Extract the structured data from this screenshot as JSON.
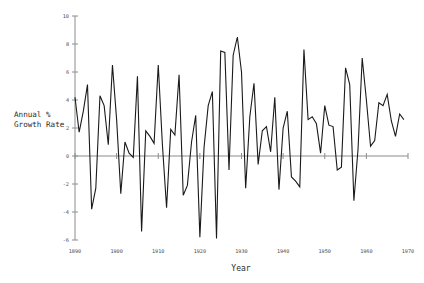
{
  "chart_data": {
    "type": "line",
    "title": "",
    "subtitle": "",
    "xlabel": "Year",
    "ylabel": "Annual %\nGrowth Rate",
    "ylabel_line1": "Annual %",
    "ylabel_line2": "Growth Rate",
    "xlim": [
      1890,
      1970
    ],
    "ylim": [
      -6,
      10
    ],
    "xticks": [
      1890,
      1900,
      1910,
      1920,
      1930,
      1940,
      1950,
      1960,
      1970
    ],
    "xtick_labels": [
      "1890",
      "1900",
      "1910",
      "1920",
      "1930",
      "1940",
      "1950",
      "1960",
      "1970"
    ],
    "yticks": [
      -6,
      -4,
      -2,
      0,
      2,
      4,
      6,
      8,
      10
    ],
    "ytick_labels": [
      "-6",
      "-4",
      "-2",
      "0",
      "2",
      "4",
      "6",
      "8",
      "10"
    ],
    "grid": false,
    "legend": null,
    "legend_position": "none",
    "zero_line": true,
    "line_color": "#1a1a1a",
    "axis_color": "#8c8c8c",
    "background_color": "#ffffff",
    "x": [
      1890,
      1891,
      1892,
      1893,
      1894,
      1895,
      1896,
      1897,
      1898,
      1899,
      1900,
      1901,
      1902,
      1903,
      1904,
      1905,
      1906,
      1907,
      1908,
      1909,
      1910,
      1911,
      1912,
      1913,
      1914,
      1915,
      1916,
      1917,
      1918,
      1919,
      1920,
      1921,
      1922,
      1923,
      1924,
      1925,
      1926,
      1927,
      1928,
      1929,
      1930,
      1931,
      1932,
      1933,
      1934,
      1935,
      1936,
      1937,
      1938,
      1939,
      1940,
      1941,
      1942,
      1943,
      1944,
      1945,
      1946,
      1947,
      1948,
      1949,
      1950,
      1951,
      1952,
      1953,
      1954,
      1955,
      1956,
      1957,
      1958,
      1959,
      1960,
      1961,
      1962,
      1963,
      1964,
      1965,
      1966,
      1967,
      1968,
      1969
    ],
    "y": [
      4.2,
      1.7,
      3.2,
      5.1,
      -3.8,
      -2.3,
      4.3,
      3.6,
      0.8,
      6.5,
      2.6,
      -2.7,
      1.0,
      0.2,
      -0.1,
      5.7,
      -5.4,
      1.8,
      1.4,
      0.9,
      6.5,
      0.8,
      -3.7,
      1.9,
      1.5,
      5.8,
      -2.8,
      -2.1,
      1.0,
      2.9,
      -5.8,
      0.6,
      3.6,
      4.6,
      -5.9,
      7.5,
      7.4,
      -1.0,
      7.2,
      8.5,
      6.0,
      -2.3,
      2.8,
      5.2,
      -0.6,
      1.8,
      2.1,
      0.3,
      4.2,
      -2.4,
      2.0,
      3.2,
      -1.5,
      -1.8,
      -2.2,
      7.6,
      2.6,
      2.8,
      2.3,
      0.2,
      3.6,
      2.2,
      2.1,
      -1.0,
      -0.8,
      6.3,
      5.1,
      -3.2,
      0.5,
      7.0,
      4.0,
      0.7,
      1.1,
      3.8,
      3.6,
      4.4,
      2.5,
      1.4,
      3.0,
      2.6
    ]
  },
  "axis_labels": {
    "x_title": "Year",
    "y_title_line1": "Annual %",
    "y_title_line2": "Growth Rate"
  }
}
